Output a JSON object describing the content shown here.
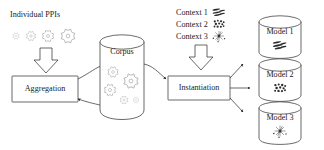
{
  "diagram": {
    "background_color": "#ffffff",
    "line_color": "#2a2a2a",
    "text_color": "#1a1a1a"
  },
  "inputs": {
    "ppi_label": "Individual PPIs",
    "gear_count": 4
  },
  "nodes": {
    "aggregation": {
      "label": "Aggregation",
      "shape": "rectangle"
    },
    "corpus": {
      "label": "Corpus",
      "shape": "cylinder",
      "gear_count": 5
    },
    "instantiation": {
      "label": "Instantiation",
      "shape": "rectangle"
    }
  },
  "contexts": [
    {
      "label": "Context 1",
      "icon": "streaks-icon"
    },
    {
      "label": "Context 2",
      "icon": "dot-cluster-icon"
    },
    {
      "label": "Context 3",
      "icon": "starburst-icon"
    }
  ],
  "models": [
    {
      "label": "Model 1",
      "icon": "streaks-icon"
    },
    {
      "label": "Model 2",
      "icon": "dot-cluster-icon"
    },
    {
      "label": "Model 3",
      "icon": "starburst-icon"
    }
  ]
}
